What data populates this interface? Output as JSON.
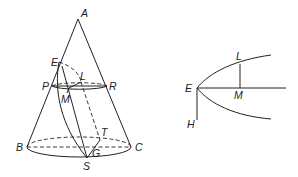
{
  "figure": {
    "left": {
      "title": "cone section",
      "labels": {
        "A": "A",
        "E": "E",
        "L": "L",
        "P": "P",
        "R": "R",
        "M": "M",
        "T": "T",
        "B": "B",
        "G": "G",
        "C": "C",
        "S": "S"
      }
    },
    "right": {
      "title": "parabola",
      "labels": {
        "L": "L",
        "E": "E",
        "M": "M",
        "H": "H"
      }
    },
    "colors": {
      "stroke": "#222222",
      "background": "#ffffff"
    }
  }
}
